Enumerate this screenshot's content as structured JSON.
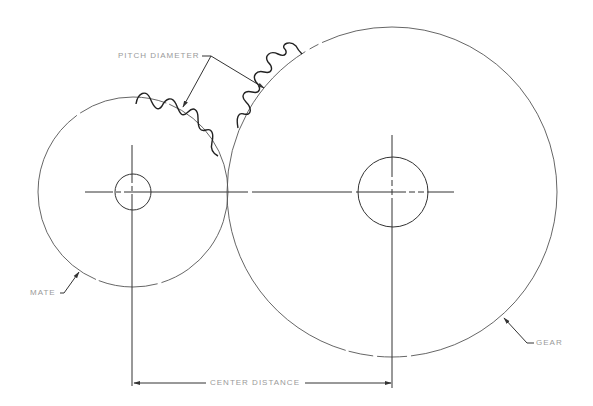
{
  "diagram": {
    "type": "gear-mesh-technical-drawing",
    "labels": {
      "pitch_diameter": "PITCH DIAMETER",
      "mate": "MATE",
      "gear": "GEAR",
      "center_distance": "CENTER DISTANCE"
    },
    "components": {
      "mate": {
        "name": "MATE",
        "role": "smaller pinion",
        "pitch_circle": {
          "cx": 133,
          "cy": 192,
          "r": 95
        },
        "hub_bore": {
          "cx": 133,
          "cy": 192,
          "r": 18
        }
      },
      "gear": {
        "name": "GEAR",
        "role": "larger gear",
        "pitch_circle": {
          "cx": 392,
          "cy": 192,
          "r": 165
        },
        "hub_bore": {
          "cx": 393,
          "cy": 192,
          "r": 35
        }
      }
    },
    "dimension": {
      "label": "CENTER DISTANCE",
      "from_x": 133,
      "to_x": 392,
      "y": 383
    },
    "colors": {
      "line": "#333333",
      "label_text": "#9a9a9a",
      "background": "#ffffff"
    }
  }
}
